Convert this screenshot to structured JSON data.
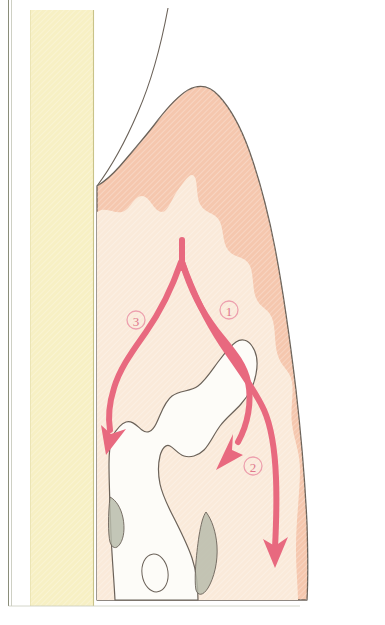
{
  "figure": {
    "width": 385,
    "height": 625
  },
  "palette": {
    "background": "#ffffff",
    "page_border_line": "#8a8d7a",
    "yellow_band": "#f7f0c4",
    "yellow_band_edge": "#c9c389",
    "gingiva_outer_pink": "#f5c7ae",
    "gingiva_inner_cream": "#faeada",
    "tissue_outline": "#6b6259",
    "bone_white": "#fdfcf8",
    "bone_outline": "#6b6259",
    "ligament_gray": "#b9bcab",
    "arrow_pink": "#e8697f",
    "arrow_pink_light": "#ef8fa0",
    "label_circle": "#eda0ae",
    "label_text": "#e0788c"
  },
  "regions": [
    {
      "id": "left-margin-rule",
      "name": "page-edge-rule",
      "label": "Left page edge rule"
    },
    {
      "id": "yellow-band",
      "name": "yellow-band",
      "label": "Pale yellow vertical band"
    },
    {
      "id": "gingiva",
      "name": "gingiva-tissue",
      "label": "Gingival soft tissue"
    },
    {
      "id": "gingiva-inner",
      "name": "gingiva-inner-zone",
      "label": "Inner cream tissue zone"
    },
    {
      "id": "crown-line",
      "name": "tooth-crown-outline",
      "label": "Tooth crown contour line"
    },
    {
      "id": "bone",
      "name": "alveolar-bone",
      "label": "Alveolar bone / tooth root"
    },
    {
      "id": "ligament-upper",
      "name": "periodontal-ligament-upper",
      "label": "Upper periodontal ligament"
    },
    {
      "id": "ligament-lower",
      "name": "periodontal-ligament-lower",
      "label": "Lower periodontal ligament"
    },
    {
      "id": "marrow-space",
      "name": "marrow-space-oval",
      "label": "Marrow space oval"
    }
  ],
  "arrows": [
    {
      "id": "arrow-1",
      "name": "pathway-arrow-1",
      "label": "1",
      "label_x": 229,
      "label_y": 310,
      "description": "Right branch curving down and out to the lateral periosteum"
    },
    {
      "id": "arrow-2",
      "name": "pathway-arrow-2",
      "label": "2",
      "label_x": 253,
      "label_y": 466,
      "description": "Right branch turning inward toward the bone crest"
    },
    {
      "id": "arrow-3",
      "name": "pathway-arrow-3",
      "label": "3",
      "label_x": 136,
      "label_y": 320,
      "description": "Left branch curving down toward the mesial bone crest"
    }
  ]
}
